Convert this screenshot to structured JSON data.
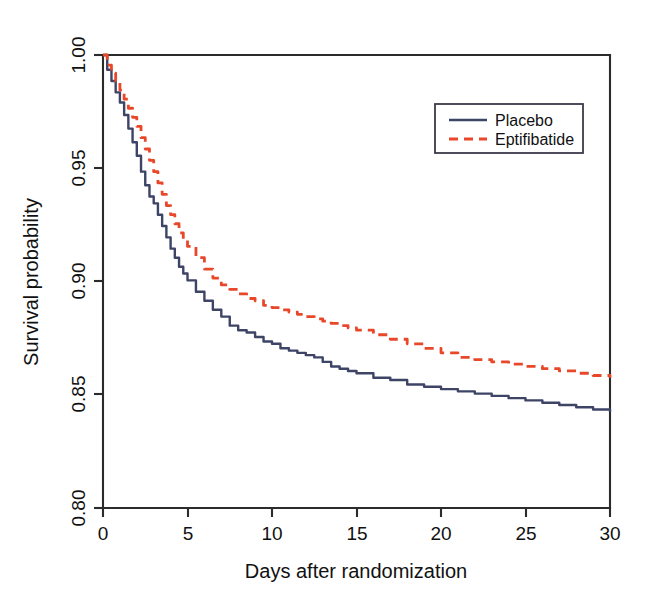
{
  "chart_data": {
    "type": "line",
    "title": "",
    "subtitle": "",
    "xlabel": "Days after randomization",
    "ylabel": "Survival probability",
    "xlim": [
      0,
      30
    ],
    "ylim": [
      0.8,
      1.0
    ],
    "xticks": [
      0,
      5,
      10,
      15,
      20,
      25,
      30
    ],
    "xtick_labels": [
      "0",
      "5",
      "10",
      "15",
      "20",
      "25",
      "30"
    ],
    "yticks": [
      0.8,
      0.85,
      0.9,
      0.95,
      1.0
    ],
    "ytick_labels": [
      "0.80",
      "0.85",
      "0.90",
      "0.95",
      "1.00"
    ],
    "grid": false,
    "legend_position": "top-right",
    "style": "kaplan-meier step curves",
    "series": [
      {
        "name": "Placebo",
        "color": "#3d4466",
        "line_style": "solid",
        "line_width": 2.4,
        "x": [
          0,
          0.25,
          0.5,
          0.75,
          1,
          1.25,
          1.5,
          1.75,
          2,
          2.25,
          2.5,
          2.75,
          3,
          3.25,
          3.5,
          3.75,
          4,
          4.25,
          4.5,
          4.75,
          5,
          5.5,
          6,
          6.5,
          7,
          7.5,
          8,
          8.5,
          9,
          9.5,
          10,
          10.5,
          11,
          11.5,
          12,
          12.5,
          13,
          13.5,
          14,
          14.5,
          15,
          16,
          17,
          18,
          19,
          20,
          21,
          22,
          23,
          24,
          25,
          26,
          27,
          28,
          29,
          30
        ],
        "y": [
          1.0,
          0.9935,
          0.9885,
          0.9835,
          0.979,
          0.9735,
          0.9675,
          0.9615,
          0.9555,
          0.9485,
          0.9425,
          0.9375,
          0.9345,
          0.9295,
          0.9245,
          0.9195,
          0.9145,
          0.9105,
          0.9065,
          0.9035,
          0.9005,
          0.8955,
          0.8915,
          0.8875,
          0.8845,
          0.8805,
          0.8785,
          0.8775,
          0.8755,
          0.8735,
          0.8725,
          0.8705,
          0.8695,
          0.8685,
          0.8675,
          0.8665,
          0.8645,
          0.8625,
          0.8615,
          0.8605,
          0.8595,
          0.8575,
          0.8565,
          0.8545,
          0.8535,
          0.8525,
          0.8515,
          0.8505,
          0.8495,
          0.8485,
          0.8475,
          0.8465,
          0.8455,
          0.8445,
          0.8435,
          0.8425
        ]
      },
      {
        "name": "Eptifibatide",
        "color": "#e8472a",
        "line_style": "dashed",
        "line_width": 2.8,
        "x": [
          0,
          0.25,
          0.5,
          0.75,
          1,
          1.25,
          1.5,
          1.75,
          2,
          2.25,
          2.5,
          2.75,
          3,
          3.25,
          3.5,
          3.75,
          4,
          4.25,
          4.5,
          4.75,
          5,
          5.5,
          6,
          6.5,
          7,
          7.5,
          8,
          8.5,
          9,
          9.5,
          10,
          10.5,
          11,
          11.5,
          12,
          12.5,
          13,
          13.5,
          14,
          14.5,
          15,
          16,
          17,
          18,
          19,
          20,
          21,
          22,
          23,
          24,
          25,
          26,
          27,
          28,
          29,
          30
        ],
        "y": [
          1.0,
          0.9955,
          0.992,
          0.9885,
          0.9845,
          0.9805,
          0.9765,
          0.9725,
          0.9685,
          0.9635,
          0.9585,
          0.9535,
          0.9485,
          0.9435,
          0.9385,
          0.9335,
          0.9295,
          0.9255,
          0.9215,
          0.9185,
          0.9155,
          0.9105,
          0.9055,
          0.9015,
          0.8985,
          0.8965,
          0.8945,
          0.8925,
          0.8915,
          0.8895,
          0.8885,
          0.8875,
          0.8865,
          0.8855,
          0.8845,
          0.8835,
          0.8825,
          0.8815,
          0.8805,
          0.8795,
          0.8785,
          0.8765,
          0.8745,
          0.8725,
          0.8705,
          0.8685,
          0.8665,
          0.8655,
          0.8645,
          0.8635,
          0.8625,
          0.8615,
          0.8605,
          0.8595,
          0.8585,
          0.8575
        ]
      }
    ],
    "legend": [
      {
        "label": "Placebo",
        "color": "#3d4466",
        "line_style": "solid"
      },
      {
        "label": "Eptifibatide",
        "color": "#e8472a",
        "line_style": "dashed"
      }
    ]
  },
  "colors": {
    "placebo": "#3d4466",
    "eptifibatide": "#e8472a",
    "axis": "#2b2b2b",
    "background": "#ffffff"
  }
}
